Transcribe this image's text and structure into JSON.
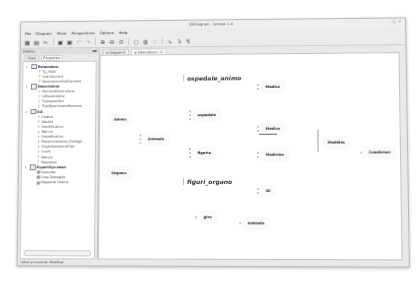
{
  "window": {
    "title": "DBDiagram - Version 1.0",
    "controls": [
      "–",
      "□",
      "×"
    ]
  },
  "menu": [
    "File",
    "Diagram",
    "Show",
    "Perspectives",
    "Options",
    "Help"
  ],
  "toolbar": {
    "buttons": [
      {
        "name": "new-diagram-icon",
        "glyph": "▦"
      },
      {
        "name": "open-icon",
        "glyph": "▤"
      },
      {
        "name": "cut-icon",
        "glyph": "✂"
      },
      {
        "name": "save-icon",
        "glyph": "▣"
      },
      {
        "name": "save-all-icon",
        "glyph": "▣"
      },
      {
        "name": "undo-icon",
        "glyph": "↶"
      },
      {
        "name": "redo-icon",
        "glyph": "↷"
      },
      {
        "name": "zoom-in-icon",
        "glyph": "⊕"
      },
      {
        "name": "zoom-out-icon",
        "glyph": "⊖"
      },
      {
        "name": "zoom-fit-icon",
        "glyph": "⊙"
      },
      {
        "name": "refresh-icon",
        "glyph": "○"
      },
      {
        "name": "settings-icon",
        "glyph": "◍"
      },
      {
        "name": "filter-icon",
        "glyph": "▽"
      },
      {
        "name": "select-tool-icon",
        "glyph": "↘"
      },
      {
        "name": "relation-tool-icon",
        "glyph": "↴"
      },
      {
        "name": "connector-tool-icon",
        "glyph": "↯"
      }
    ]
  },
  "left_panel": {
    "title": "Outline",
    "tabs": [
      "Views",
      "Properties"
    ],
    "groups": [
      {
        "label": "Estensione",
        "items": [
          {
            "icon": "field",
            "label": "Tp_Field"
          },
          {
            "icon": "field",
            "label": "Sub Element"
          },
          {
            "icon": "field",
            "label": "DescriptionSubElement"
          }
        ]
      },
      {
        "label": "Descrizione",
        "items": [
          {
            "icon": "field",
            "label": "NumeroDescrizione"
          },
          {
            "icon": "field",
            "label": "IdEsposizione"
          },
          {
            "icon": "field",
            "label": "Tipospecifico"
          },
          {
            "icon": "field",
            "label": "TipoDescrizioneNumero"
          }
        ]
      },
      {
        "label": "Kit",
        "items": [
          {
            "icon": "key",
            "label": "Codice"
          },
          {
            "icon": "key",
            "label": "Tabella"
          },
          {
            "icon": "key",
            "label": "Identificativo"
          },
          {
            "icon": "key",
            "label": "Nature"
          },
          {
            "icon": "field",
            "label": "Identificativo"
          },
          {
            "icon": "field",
            "label": "Denominazione_Dettagli"
          },
          {
            "icon": "field",
            "label": "OrganizzazioneEnte"
          },
          {
            "icon": "field",
            "label": "Livelli"
          },
          {
            "icon": "field",
            "label": "Natura"
          },
          {
            "icon": "field",
            "label": "Posizione"
          }
        ]
      },
      {
        "label": "ExportSys.bean",
        "items": [
          {
            "icon": "table",
            "label": "Seconda"
          },
          {
            "icon": "table",
            "label": "Crea Dettaglio"
          },
          {
            "icon": "table",
            "label": "Rapporto Ordine"
          }
        ]
      }
    ]
  },
  "editor": {
    "tabs": [
      {
        "label": "Diagram1",
        "active": false
      },
      {
        "label": "Alternativo1.12",
        "active": true
      }
    ],
    "titles": [
      {
        "label": "ospedale_animo",
        "x": 84,
        "y": 20
      },
      {
        "label": "figuri_organo",
        "x": 84,
        "y": 124
      }
    ],
    "nodes": [
      {
        "label": "Animo",
        "x": 10,
        "y": 60,
        "ports": 0
      },
      {
        "label": "Animale",
        "x": 40,
        "y": 80,
        "ports": 3
      },
      {
        "label": "Organo",
        "x": 8,
        "y": 114,
        "ports": 0
      },
      {
        "label": "ospedale",
        "x": 90,
        "y": 56,
        "ports": 3
      },
      {
        "label": "figuria",
        "x": 90,
        "y": 94,
        "ports": 3
      },
      {
        "label": "Medico",
        "x": 158,
        "y": 28,
        "ports": 2
      },
      {
        "label": "Medico",
        "x": 158,
        "y": 70,
        "ports": 2
      },
      {
        "label": "Medicina",
        "x": 158,
        "y": 96,
        "ports": 2
      },
      {
        "label": "ID",
        "x": 158,
        "y": 132,
        "ports": 2
      },
      {
        "label": "giro",
        "x": 96,
        "y": 158,
        "ports": 1
      },
      {
        "label": "Animale",
        "x": 140,
        "y": 164,
        "ports": 1
      },
      {
        "label": "Medidas",
        "x": 224,
        "y": 84,
        "ports": 0
      },
      {
        "label": "Condicioni",
        "x": 260,
        "y": 94,
        "ports": 1
      }
    ]
  },
  "status": {
    "text": "Valori procedura: Modified"
  }
}
